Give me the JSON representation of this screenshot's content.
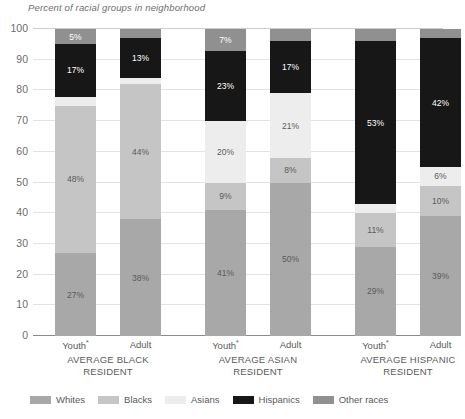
{
  "chart_data": {
    "type": "bar",
    "title": "Percent of racial groups in neighborhood",
    "subtitle": "",
    "xlabel": "",
    "ylabel": "",
    "ylim": [
      0,
      100
    ],
    "ytick_labels": [
      "0",
      "10",
      "20",
      "30",
      "40",
      "50",
      "60",
      "70",
      "80",
      "90",
      "100"
    ],
    "ytick_values": [
      0,
      10,
      20,
      30,
      40,
      50,
      60,
      70,
      80,
      90,
      100
    ],
    "grid": true,
    "stacked": true,
    "legend_position": "bottom",
    "legend": [
      "Whites",
      "Blacks",
      "Asians",
      "Hispanics",
      "Other races"
    ],
    "series_colors": {
      "Whites": "#a8a8a8",
      "Blacks": "#c5c5c5",
      "Asians": "#ededed",
      "Hispanics": "#171717",
      "Other races": "#909090"
    },
    "groups": [
      {
        "name": "AVERAGE BLACK RESIDENT",
        "name_line1": "AVERAGE BLACK",
        "name_line2": "RESIDENT",
        "bars": [
          {
            "label": "Youth",
            "footnote": "*"
          },
          {
            "label": "Adult",
            "footnote": ""
          }
        ]
      },
      {
        "name": "AVERAGE ASIAN RESIDENT",
        "name_line1": "AVERAGE ASIAN",
        "name_line2": "RESIDENT",
        "bars": [
          {
            "label": "Youth",
            "footnote": "*"
          },
          {
            "label": "Adult",
            "footnote": ""
          }
        ]
      },
      {
        "name": "AVERAGE HISPANIC RESIDENT",
        "name_line1": "AVERAGE HISPANIC",
        "name_line2": "RESIDENT",
        "bars": [
          {
            "label": "Youth",
            "footnote": "*"
          },
          {
            "label": "Adult",
            "footnote": ""
          }
        ]
      }
    ],
    "categories": [
      "AVERAGE BLACK RESIDENT - Youth",
      "AVERAGE BLACK RESIDENT - Adult",
      "AVERAGE ASIAN RESIDENT - Youth",
      "AVERAGE ASIAN RESIDENT - Adult",
      "AVERAGE HISPANIC RESIDENT - Youth",
      "AVERAGE HISPANIC RESIDENT - Adult"
    ],
    "series": [
      {
        "name": "Whites",
        "values": [
          27,
          38,
          41,
          50,
          29,
          39
        ]
      },
      {
        "name": "Blacks",
        "values": [
          48,
          44,
          9,
          8,
          11,
          10
        ]
      },
      {
        "name": "Asians",
        "values": [
          3,
          2,
          20,
          21,
          3,
          6
        ]
      },
      {
        "name": "Hispanics",
        "values": [
          17,
          13,
          23,
          17,
          53,
          42
        ]
      },
      {
        "name": "Other races",
        "values": [
          5,
          3,
          7,
          4,
          4,
          3
        ]
      }
    ],
    "bar_stacks": [
      {
        "group": "AVERAGE BLACK RESIDENT",
        "bar": "Youth",
        "segments": [
          {
            "name": "Whites",
            "value": 27,
            "label": "27%",
            "show_label": true,
            "label_style": "dark"
          },
          {
            "name": "Blacks",
            "value": 48,
            "label": "48%",
            "show_label": true,
            "label_style": "dark"
          },
          {
            "name": "Asians",
            "value": 3,
            "label": "",
            "show_label": false,
            "label_style": "dark"
          },
          {
            "name": "Hispanics",
            "value": 17,
            "label": "17%",
            "show_label": true,
            "label_style": "light"
          },
          {
            "name": "Other races",
            "value": 5,
            "label": "5%",
            "show_label": true,
            "label_style": "light"
          }
        ]
      },
      {
        "group": "AVERAGE BLACK RESIDENT",
        "bar": "Adult",
        "segments": [
          {
            "name": "Whites",
            "value": 38,
            "label": "38%",
            "show_label": true,
            "label_style": "dark"
          },
          {
            "name": "Blacks",
            "value": 44,
            "label": "44%",
            "show_label": true,
            "label_style": "dark"
          },
          {
            "name": "Asians",
            "value": 2,
            "label": "",
            "show_label": false,
            "label_style": "dark"
          },
          {
            "name": "Hispanics",
            "value": 13,
            "label": "13%",
            "show_label": true,
            "label_style": "light"
          },
          {
            "name": "Other races",
            "value": 3,
            "label": "",
            "show_label": false,
            "label_style": "light"
          }
        ]
      },
      {
        "group": "AVERAGE ASIAN RESIDENT",
        "bar": "Youth",
        "segments": [
          {
            "name": "Whites",
            "value": 41,
            "label": "41%",
            "show_label": true,
            "label_style": "dark"
          },
          {
            "name": "Blacks",
            "value": 9,
            "label": "9%",
            "show_label": true,
            "label_style": "dark"
          },
          {
            "name": "Asians",
            "value": 20,
            "label": "20%",
            "show_label": true,
            "label_style": "dark"
          },
          {
            "name": "Hispanics",
            "value": 23,
            "label": "23%",
            "show_label": true,
            "label_style": "light"
          },
          {
            "name": "Other races",
            "value": 7,
            "label": "7%",
            "show_label": true,
            "label_style": "light"
          }
        ]
      },
      {
        "group": "AVERAGE ASIAN RESIDENT",
        "bar": "Adult",
        "segments": [
          {
            "name": "Whites",
            "value": 50,
            "label": "50%",
            "show_label": true,
            "label_style": "dark"
          },
          {
            "name": "Blacks",
            "value": 8,
            "label": "8%",
            "show_label": true,
            "label_style": "dark"
          },
          {
            "name": "Asians",
            "value": 21,
            "label": "21%",
            "show_label": true,
            "label_style": "dark"
          },
          {
            "name": "Hispanics",
            "value": 17,
            "label": "17%",
            "show_label": true,
            "label_style": "light"
          },
          {
            "name": "Other races",
            "value": 4,
            "label": "",
            "show_label": false,
            "label_style": "light"
          }
        ]
      },
      {
        "group": "AVERAGE HISPANIC RESIDENT",
        "bar": "Youth",
        "segments": [
          {
            "name": "Whites",
            "value": 29,
            "label": "29%",
            "show_label": true,
            "label_style": "dark"
          },
          {
            "name": "Blacks",
            "value": 11,
            "label": "11%",
            "show_label": true,
            "label_style": "dark"
          },
          {
            "name": "Asians",
            "value": 3,
            "label": "",
            "show_label": false,
            "label_style": "dark"
          },
          {
            "name": "Hispanics",
            "value": 53,
            "label": "53%",
            "show_label": true,
            "label_style": "light"
          },
          {
            "name": "Other races",
            "value": 4,
            "label": "",
            "show_label": false,
            "label_style": "light"
          }
        ]
      },
      {
        "group": "AVERAGE HISPANIC RESIDENT",
        "bar": "Adult",
        "segments": [
          {
            "name": "Whites",
            "value": 39,
            "label": "39%",
            "show_label": true,
            "label_style": "dark"
          },
          {
            "name": "Blacks",
            "value": 10,
            "label": "10%",
            "show_label": true,
            "label_style": "dark"
          },
          {
            "name": "Asians",
            "value": 6,
            "label": "6%",
            "show_label": true,
            "label_style": "dark"
          },
          {
            "name": "Hispanics",
            "value": 42,
            "label": "42%",
            "show_label": true,
            "label_style": "light"
          },
          {
            "name": "Other races",
            "value": 3,
            "label": "",
            "show_label": false,
            "label_style": "light"
          }
        ]
      }
    ]
  }
}
